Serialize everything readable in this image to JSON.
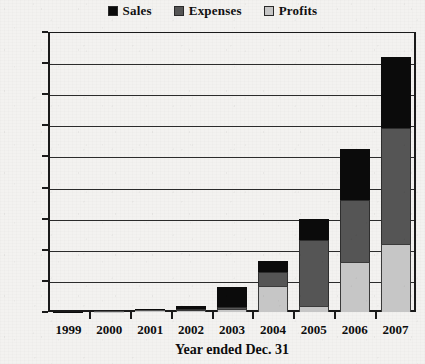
{
  "chart_data": {
    "type": "bar",
    "stacked": true,
    "title": "",
    "xlabel": "Year ended Dec. 31",
    "ylabel": "",
    "categories": [
      "1999",
      "2000",
      "2001",
      "2002",
      "2003",
      "2004",
      "2005",
      "2006",
      "2007"
    ],
    "series": [
      {
        "name": "Profits",
        "color": "#c6c6c6",
        "values": [
          0.0,
          0.02,
          0.05,
          0.1,
          0.2,
          1.7,
          0.4,
          3.2,
          4.4
        ]
      },
      {
        "name": "Expenses",
        "color": "#555555",
        "values": [
          0.0,
          0.02,
          0.05,
          0.1,
          0.1,
          0.9,
          4.2,
          4.0,
          7.4
        ]
      },
      {
        "name": "Sales",
        "color": "#0b0b0b",
        "values": [
          0.02,
          0.03,
          0.08,
          0.2,
          1.3,
          0.7,
          1.4,
          3.3,
          4.6
        ]
      }
    ],
    "totals": [
      0.02,
      0.07,
      0.18,
      0.4,
      1.6,
      3.3,
      6.0,
      10.5,
      16.4
    ],
    "ylim": [
      0,
      18
    ],
    "ytick_values": [
      0,
      2,
      4,
      6,
      8,
      10,
      12,
      14,
      16,
      18
    ],
    "ytick_labels": [
      "$0",
      "$2",
      "$4",
      "$6",
      "$8",
      "$10",
      "$12",
      "$14",
      "$16",
      "$18"
    ],
    "grid": true,
    "legend_position": "top-center",
    "legend_entries": [
      "Sales",
      "Expenses",
      "Profits"
    ]
  },
  "legend": {
    "items": [
      {
        "label": "Sales",
        "swatch": "legend-swatch-sales"
      },
      {
        "label": "Expenses",
        "swatch": "legend-swatch-expenses"
      },
      {
        "label": "Profits",
        "swatch": "legend-swatch-profits"
      }
    ]
  },
  "axes": {
    "x_title": "Year ended Dec. 31"
  }
}
